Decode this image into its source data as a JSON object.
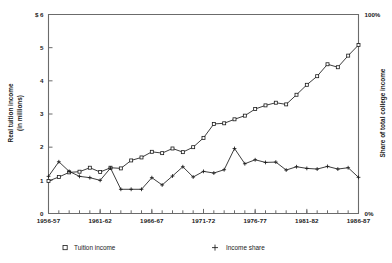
{
  "chart_data": {
    "type": "line",
    "title": "",
    "xlabel": "",
    "ylabel": "Real tuition income (in millions)",
    "y2label": "Share of total college income",
    "ylim": [
      0,
      6
    ],
    "y2lim": [
      0,
      100
    ],
    "grid": false,
    "legend_position": "bottom",
    "left_axis_prefix": "$",
    "left_tick_labels": [
      "$ 6",
      "5",
      "4",
      "3",
      "2",
      "1",
      "0"
    ],
    "left_tick_values": [
      6,
      5,
      4,
      3,
      2,
      1,
      0
    ],
    "right_tick_labels": [
      "100%",
      "0%"
    ],
    "right_tick_values": [
      100,
      0
    ],
    "x_tick_labels": [
      "1956-57",
      "1961-62",
      "1966-67",
      "1971-72",
      "1976-77",
      "1981-82",
      "1986-87"
    ],
    "x_tick_indices": [
      0,
      5,
      10,
      15,
      20,
      25,
      30
    ],
    "x": [
      "1956-57",
      "1957-58",
      "1958-59",
      "1959-60",
      "1960-61",
      "1961-62",
      "1962-63",
      "1963-64",
      "1964-65",
      "1965-66",
      "1966-67",
      "1967-68",
      "1968-69",
      "1969-70",
      "1970-71",
      "1971-72",
      "1972-73",
      "1973-74",
      "1974-75",
      "1975-76",
      "1976-77",
      "1977-78",
      "1978-79",
      "1979-80",
      "1980-81",
      "1981-82",
      "1982-83",
      "1983-84",
      "1984-85",
      "1985-86",
      "1986-87"
    ],
    "series": [
      {
        "name": "Tuition income",
        "marker": "square",
        "axis": "left",
        "unit": "millions of dollars",
        "values": [
          0.98,
          1.1,
          1.24,
          1.26,
          1.38,
          1.25,
          1.38,
          1.36,
          1.6,
          1.69,
          1.86,
          1.82,
          1.96,
          1.85,
          2.0,
          2.28,
          2.7,
          2.72,
          2.84,
          2.95,
          3.15,
          3.26,
          3.34,
          3.29,
          3.58,
          3.88,
          4.14,
          4.5,
          4.41,
          4.76,
          5.08
        ]
      },
      {
        "name": "Income share",
        "marker": "plus",
        "axis": "right",
        "unit": "percent of total college income",
        "values_left_scale": [
          1.12,
          1.56,
          1.27,
          1.12,
          1.08,
          1.0,
          1.37,
          0.73,
          0.73,
          0.73,
          1.08,
          0.86,
          1.13,
          1.41,
          1.1,
          1.27,
          1.22,
          1.32,
          1.96,
          1.5,
          1.62,
          1.54,
          1.55,
          1.31,
          1.41,
          1.36,
          1.34,
          1.42,
          1.34,
          1.38,
          1.09
        ],
        "values": [
          18.7,
          26.0,
          21.2,
          18.7,
          18.0,
          16.7,
          22.8,
          12.2,
          12.2,
          12.2,
          18.0,
          14.3,
          18.8,
          23.5,
          18.3,
          21.2,
          20.3,
          22.0,
          32.7,
          25.0,
          27.0,
          25.7,
          25.8,
          21.8,
          23.5,
          22.7,
          22.3,
          23.7,
          22.3,
          23.0,
          18.2
        ]
      }
    ],
    "legend": [
      {
        "label": "Tuition income",
        "marker": "square"
      },
      {
        "label": "Income share",
        "marker": "plus"
      }
    ]
  }
}
